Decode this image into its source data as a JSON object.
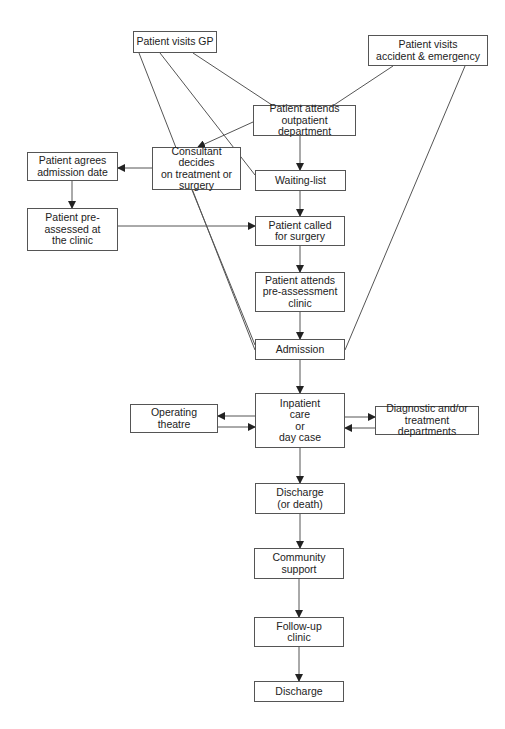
{
  "diagram": {
    "type": "flowchart",
    "title": "",
    "nodes": [
      {
        "id": "gp",
        "label": "Patient visits GP",
        "x": 133,
        "y": 31,
        "w": 84,
        "h": 22
      },
      {
        "id": "ae",
        "label": "Patient visits\naccident & emergency",
        "x": 368,
        "y": 35,
        "w": 120,
        "h": 31
      },
      {
        "id": "outpatient",
        "label": "Patient attends\noutpatient department",
        "x": 253,
        "y": 105,
        "w": 103,
        "h": 31
      },
      {
        "id": "consultant",
        "label": "Consultant decides\non treatment or\nsurgery",
        "x": 152,
        "y": 147,
        "w": 89,
        "h": 43
      },
      {
        "id": "agrees",
        "label": "Patient agrees\nadmission date",
        "x": 27,
        "y": 152,
        "w": 91,
        "h": 29
      },
      {
        "id": "waiting",
        "label": "Waiting-list",
        "x": 255,
        "y": 170,
        "w": 91,
        "h": 21
      },
      {
        "id": "preassessed",
        "label": "Patient pre-\nassessed at\nthe clinic",
        "x": 27,
        "y": 208,
        "w": 91,
        "h": 43
      },
      {
        "id": "called",
        "label": "Patient  called\nfor surgery",
        "x": 255,
        "y": 216,
        "w": 90,
        "h": 30
      },
      {
        "id": "preclinic",
        "label": "Patient  attends\npre-assessment\nclinic",
        "x": 255,
        "y": 272,
        "w": 90,
        "h": 40
      },
      {
        "id": "admission",
        "label": "Admission",
        "x": 255,
        "y": 339,
        "w": 90,
        "h": 21
      },
      {
        "id": "inpatient",
        "label": "Inpatient\ncare\nor\nday case",
        "x": 255,
        "y": 393,
        "w": 90,
        "h": 55
      },
      {
        "id": "theatre",
        "label": "Operating\ntheatre",
        "x": 130,
        "y": 404,
        "w": 88,
        "h": 29
      },
      {
        "id": "diagnostic",
        "label": "Diagnostic and/or\ntreatment departments",
        "x": 375,
        "y": 406,
        "w": 104,
        "h": 29
      },
      {
        "id": "discharge1",
        "label": "Discharge\n(or death)",
        "x": 255,
        "y": 483,
        "w": 90,
        "h": 31
      },
      {
        "id": "community",
        "label": "Community\nsupport",
        "x": 254,
        "y": 548,
        "w": 90,
        "h": 31
      },
      {
        "id": "followup",
        "label": "Follow-up\nclinic",
        "x": 254,
        "y": 617,
        "w": 90,
        "h": 30
      },
      {
        "id": "discharge2",
        "label": "Discharge",
        "x": 254,
        "y": 681,
        "w": 90,
        "h": 21
      }
    ],
    "edges": [
      {
        "from": "gp",
        "to": "outpatient",
        "arrow": false,
        "points": [
          [
            193,
            53
          ],
          [
            272,
            105
          ]
        ]
      },
      {
        "from": "gp",
        "to": "waiting",
        "arrow": false,
        "points": [
          [
            160,
            53
          ],
          [
            255,
            175
          ]
        ]
      },
      {
        "from": "gp",
        "to": "admission",
        "arrow": false,
        "points": [
          [
            139,
            53
          ],
          [
            255,
            350
          ]
        ]
      },
      {
        "from": "ae",
        "to": "outpatient",
        "arrow": false,
        "points": [
          [
            393,
            66
          ],
          [
            334,
            105
          ]
        ]
      },
      {
        "from": "ae",
        "to": "admission",
        "arrow": false,
        "points": [
          [
            465,
            66
          ],
          [
            345,
            350
          ]
        ]
      },
      {
        "from": "outpatient",
        "to": "consultant",
        "arrow": true,
        "points": [
          [
            253,
            122
          ],
          [
            198,
            147
          ]
        ]
      },
      {
        "from": "outpatient",
        "to": "waiting",
        "arrow": true,
        "points": [
          [
            300,
            136
          ],
          [
            300,
            170
          ]
        ]
      },
      {
        "from": "consultant",
        "to": "agrees",
        "arrow": true,
        "points": [
          [
            152,
            168
          ],
          [
            118,
            168
          ]
        ]
      },
      {
        "from": "consultant",
        "to": "admission",
        "arrow": false,
        "points": [
          [
            192,
            190
          ],
          [
            255,
            345
          ]
        ]
      },
      {
        "from": "agrees",
        "to": "preassessed",
        "arrow": true,
        "points": [
          [
            72,
            181
          ],
          [
            72,
            208
          ]
        ]
      },
      {
        "from": "preassessed",
        "to": "called",
        "arrow": true,
        "points": [
          [
            118,
            226
          ],
          [
            255,
            226
          ]
        ]
      },
      {
        "from": "waiting",
        "to": "called",
        "arrow": true,
        "points": [
          [
            300,
            191
          ],
          [
            300,
            216
          ]
        ]
      },
      {
        "from": "called",
        "to": "preclinic",
        "arrow": true,
        "points": [
          [
            300,
            246
          ],
          [
            300,
            272
          ]
        ]
      },
      {
        "from": "preclinic",
        "to": "admission",
        "arrow": true,
        "points": [
          [
            300,
            312
          ],
          [
            300,
            339
          ]
        ]
      },
      {
        "from": "admission",
        "to": "inpatient",
        "arrow": true,
        "points": [
          [
            300,
            360
          ],
          [
            300,
            393
          ]
        ]
      },
      {
        "from": "inpatient",
        "to": "theatre",
        "arrow": true,
        "points": [
          [
            255,
            416
          ],
          [
            218,
            416
          ]
        ]
      },
      {
        "from": "theatre",
        "to": "inpatient",
        "arrow": true,
        "points": [
          [
            218,
            427
          ],
          [
            255,
            427
          ]
        ]
      },
      {
        "from": "inpatient",
        "to": "diagnostic",
        "arrow": true,
        "points": [
          [
            345,
            417
          ],
          [
            375,
            417
          ]
        ]
      },
      {
        "from": "diagnostic",
        "to": "inpatient",
        "arrow": true,
        "points": [
          [
            375,
            428
          ],
          [
            345,
            428
          ]
        ]
      },
      {
        "from": "inpatient",
        "to": "discharge1",
        "arrow": true,
        "points": [
          [
            300,
            448
          ],
          [
            300,
            483
          ]
        ]
      },
      {
        "from": "discharge1",
        "to": "community",
        "arrow": true,
        "points": [
          [
            300,
            514
          ],
          [
            300,
            548
          ]
        ]
      },
      {
        "from": "community",
        "to": "followup",
        "arrow": true,
        "points": [
          [
            299,
            579
          ],
          [
            299,
            617
          ]
        ]
      },
      {
        "from": "followup",
        "to": "discharge2",
        "arrow": true,
        "points": [
          [
            299,
            647
          ],
          [
            299,
            681
          ]
        ]
      }
    ]
  },
  "colors": {
    "line": "#555555",
    "arrowhead": "#222222",
    "box_border": "#555555",
    "text": "#222222",
    "background": "#ffffff"
  }
}
